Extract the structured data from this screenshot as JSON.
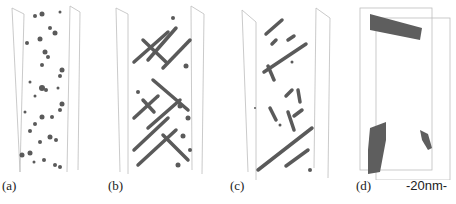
{
  "figure": {
    "panels": [
      {
        "id": "a",
        "label": "(a)",
        "description": "small dispersed precipitate clusters"
      },
      {
        "id": "b",
        "label": "(b)",
        "description": "crossed rod-shaped precipitates"
      },
      {
        "id": "c",
        "label": "(c)",
        "description": "fewer, longer rod precipitates"
      },
      {
        "id": "d",
        "label": "(d)",
        "description": "large coarse precipitates"
      }
    ],
    "scale_bar": "-20nm-",
    "colors": {
      "frame": "#bdbdbd",
      "precipitate": "#5a5a5a",
      "text": "#222222"
    }
  }
}
